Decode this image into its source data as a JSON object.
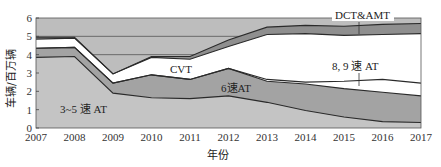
{
  "chart_data": {
    "type": "area",
    "title": "",
    "xlabel": "年份",
    "ylabel": "车辆/百万辆",
    "x": [
      2007,
      2008,
      2009,
      2010,
      2011,
      2012,
      2013,
      2014,
      2015,
      2016,
      2017
    ],
    "xtick_labels": [
      "2007",
      "2008",
      "2009",
      "2010",
      "2011",
      "2012",
      "2013",
      "2014",
      "2015",
      "2016",
      "2017"
    ],
    "ytick_labels": [
      "0",
      "1",
      "2",
      "3",
      "4",
      "5",
      "6"
    ],
    "ylim": [
      0,
      6
    ],
    "xlim": [
      2007,
      2017
    ],
    "grid": "horizontal lines at 4 and 5",
    "stacked": true,
    "series": [
      {
        "name": "3~5 速 AT",
        "cumulative_top": [
          3.85,
          3.9,
          1.9,
          1.65,
          1.6,
          1.75,
          1.4,
          0.95,
          0.6,
          0.35,
          0.3
        ],
        "color": "#c4c4c4"
      },
      {
        "name": "6速AT",
        "cumulative_top": [
          4.35,
          4.4,
          2.45,
          2.9,
          2.65,
          3.25,
          2.55,
          2.4,
          2.15,
          1.95,
          1.75
        ],
        "color": "#a3a3a3"
      },
      {
        "name": "8, 9 速 AT",
        "cumulative_top": [
          4.35,
          4.4,
          2.45,
          2.9,
          2.65,
          3.25,
          2.65,
          2.5,
          2.55,
          2.65,
          2.45
        ],
        "color": "#ffffff"
      },
      {
        "name": "CVT",
        "cumulative_top": [
          4.85,
          4.9,
          2.95,
          3.85,
          3.75,
          4.45,
          5.1,
          5.15,
          5.05,
          5.1,
          5.15
        ],
        "color": "#ffffff"
      },
      {
        "name": "DCT&AMT",
        "cumulative_top": [
          4.95,
          4.95,
          2.95,
          3.9,
          3.9,
          4.8,
          5.5,
          5.6,
          5.55,
          5.65,
          5.7
        ],
        "color": "#8f8f8f"
      }
    ],
    "background_band_color": "#bdbdbd",
    "annotations": [
      {
        "text": "3~5 速 AT",
        "x": 2008.2,
        "y": 1.0
      },
      {
        "text": "6速AT",
        "x": 2012.0,
        "y": 2.1
      },
      {
        "text": "CVT",
        "x": 2010.5,
        "y": 3.3
      },
      {
        "text": "8, 9 速 AT",
        "x": 2015.4,
        "y": 3.6
      },
      {
        "text": "DCT&AMT",
        "x": 2015.4,
        "y": 6.0
      }
    ]
  },
  "labels": {
    "ylabel": "车辆/百万辆",
    "xlabel": "年份",
    "ann_35at": "3~5 速 AT",
    "ann_6at": "6速AT",
    "ann_cvt": "CVT",
    "ann_89at": "8, 9 速 AT",
    "ann_dct": "DCT&AMT"
  }
}
